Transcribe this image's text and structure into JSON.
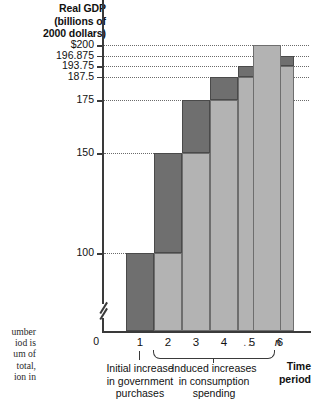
{
  "chart_data": {
    "type": "bar",
    "title": "",
    "ylabel": "Real GDP (billions of 2000 dollars)",
    "xlabel": "Time period",
    "grid": true,
    "legend": "none",
    "ylim": [
      93.75,
      203.125
    ],
    "categories": [
      "1",
      "2",
      "3",
      "4",
      "5",
      "6",
      "...",
      "n"
    ],
    "values": [
      100,
      150,
      175,
      187.5,
      193.75,
      196.875,
      null,
      200
    ],
    "ytick_labels": [
      "$200",
      "196.875",
      "193.75",
      "187.5",
      "175",
      "150",
      "100",
      "0"
    ],
    "ytick_values": [
      200,
      196.875,
      193.75,
      187.5,
      175,
      150,
      100,
      0
    ],
    "series": [
      {
        "name": "Prior level (light)",
        "values": [
          0,
          100,
          150,
          175,
          187.5,
          193.75,
          null,
          200
        ]
      },
      {
        "name": "New increment (dark)",
        "values": [
          100,
          50,
          25,
          12.5,
          6.25,
          3.125,
          null,
          0
        ]
      }
    ],
    "annotations": [
      "Initial increase in government purchases",
      "Induced increases in consumption spending"
    ]
  },
  "axis": {
    "y_title_lines": [
      "Real GDP",
      "(billions of",
      "2000 dollars)"
    ],
    "x_title_lines": [
      "Time",
      "period"
    ],
    "zero_label": "0"
  },
  "yticks": [
    {
      "label": "$200",
      "value": 200
    },
    {
      "label": "196.875",
      "value": 196.875
    },
    {
      "label": "193.75",
      "value": 193.75
    },
    {
      "label": "187.5",
      "value": 187.5
    },
    {
      "label": "175",
      "value": 175
    },
    {
      "label": "150",
      "value": 150
    },
    {
      "label": "100",
      "value": 100
    }
  ],
  "xticks": [
    {
      "label": "1"
    },
    {
      "label": "2"
    },
    {
      "label": "3"
    },
    {
      "label": "4"
    },
    {
      "label": "5"
    },
    {
      "label": "6"
    },
    {
      "label": "..."
    },
    {
      "label": "n"
    }
  ],
  "captions": {
    "initial": [
      "Initial increase",
      "in government",
      "purchases"
    ],
    "induced": [
      "Induced increases",
      "in consumption",
      "spending"
    ]
  },
  "margin_note_lines": [
    "umber",
    "iod is",
    "um of",
    "total,",
    "ion in"
  ],
  "colors": {
    "bar_light": "#b3b3b3",
    "bar_dark": "#6f6f6f",
    "axis": "#3a3a3a",
    "gridline": "#6a6a6a",
    "text": "#111111"
  }
}
